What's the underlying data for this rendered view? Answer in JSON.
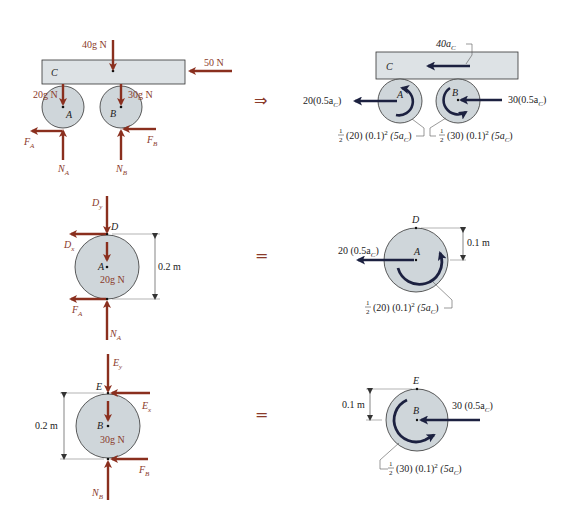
{
  "colors": {
    "force_arrow": "#8a2f1e",
    "inertia_arrow": "#1c2140",
    "body_fill": "#cfd6da",
    "body_stroke": "#333333",
    "plate_fill": "#dde2e5",
    "relation_symbol": "#8a3a2a",
    "label_text": "#222222"
  },
  "row1": {
    "relation": "⇒",
    "fbd": {
      "plate_label": "C",
      "weight_C": "40g N",
      "applied_force": "50 N",
      "weight_A": "20g N",
      "weight_B": "30g N",
      "disk_A_label": "A",
      "disk_B_label": "B",
      "friction_A": "F",
      "friction_A_sub": "A",
      "friction_B": "F",
      "friction_B_sub": "B",
      "normal_A": "N",
      "normal_A_sub": "A",
      "normal_B": "N",
      "normal_B_sub": "B"
    },
    "kd": {
      "plate_label": "C",
      "plate_inertia": "40a",
      "plate_inertia_sub": "C",
      "disk_A_label": "A",
      "disk_B_label": "B",
      "inertia_A": "20(0.5a",
      "inertia_A_sub": "C",
      "inertia_A_end": ")",
      "inertia_B": "30(0.5a",
      "inertia_B_sub": "C",
      "inertia_B_end": ")",
      "moment_A_prefix": "(20) (0.1)",
      "moment_A_exp": "2",
      "moment_A_tail": " (5a",
      "moment_A_sub": "C",
      "moment_A_end": ")",
      "moment_B_prefix": "(30) (0.1)",
      "moment_B_exp": "2",
      "moment_B_tail": " (5a",
      "moment_B_sub": "C",
      "moment_B_end": ")",
      "half_num": "1",
      "half_den": "2"
    }
  },
  "row2": {
    "relation": "=",
    "fbd": {
      "Dy": "D",
      "Dy_sub": "y",
      "D_point": "D",
      "Dx": "D",
      "Dx_sub": "x",
      "center": "A",
      "weight": "20g N",
      "dimension": "0.2 m",
      "friction": "F",
      "friction_sub": "A",
      "normal": "N",
      "normal_sub": "A"
    },
    "kd": {
      "D_point": "D",
      "center": "A",
      "dimension": "0.1 m",
      "inertia": "20 (0.5a",
      "inertia_sub": "C",
      "inertia_end": ")",
      "moment_prefix": "(20) (0.1)",
      "moment_exp": "2",
      "moment_tail": " (5a",
      "moment_sub": "C",
      "moment_end": ")",
      "half_num": "1",
      "half_den": "2"
    }
  },
  "row3": {
    "relation": "=",
    "fbd": {
      "Ey": "E",
      "Ey_sub": "y",
      "E_point": "E",
      "Ex": "E",
      "Ex_sub": "x",
      "center": "B",
      "weight": "30g N",
      "dimension": "0.2 m",
      "friction": "F",
      "friction_sub": "B",
      "normal": "N",
      "normal_sub": "B"
    },
    "kd": {
      "E_point": "E",
      "center": "B",
      "dimension": "0.1 m",
      "inertia": "30 (0.5a",
      "inertia_sub": "C",
      "inertia_end": ")",
      "moment_prefix": "(30) (0.1)",
      "moment_exp": "2",
      "moment_tail": " (5a",
      "moment_sub": "C",
      "moment_end": ")",
      "half_num": "1",
      "half_den": "2"
    }
  }
}
